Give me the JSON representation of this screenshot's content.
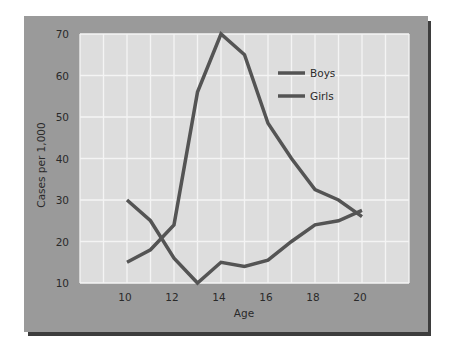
{
  "chart_data": {
    "type": "line",
    "title": "",
    "xlabel": "Age",
    "ylabel": "Cases per 1,000",
    "xlim": [
      8,
      22
    ],
    "ylim": [
      10,
      70
    ],
    "x_ticks": [
      10,
      12,
      14,
      16,
      18,
      20
    ],
    "y_ticks": [
      10,
      20,
      30,
      40,
      50,
      60,
      70
    ],
    "grid": true,
    "legend_position": "upper right (inside plot)",
    "x": [
      10,
      11,
      12,
      13,
      14,
      15,
      16,
      17,
      18,
      19,
      20
    ],
    "series": [
      {
        "name": "Boys",
        "values": [
          30,
          25,
          16,
          10,
          15,
          14,
          15.5,
          20,
          24,
          25,
          27.5
        ]
      },
      {
        "name": "Girls",
        "values": [
          15,
          18,
          24,
          56,
          70,
          65,
          48.5,
          40,
          32.5,
          30,
          26
        ]
      }
    ]
  },
  "colors": {
    "panel": "#9a9a9a",
    "shadow": "#3d3d3d",
    "plot_bg": "#dddddd",
    "grid": "#f4f4f4",
    "boys_line": "#545454",
    "girls_line": "#545454",
    "text": "#2a2a2a"
  },
  "labels": {
    "xlabel": "Age",
    "ylabel": "Cases per 1,000",
    "legend": [
      "Boys",
      "Girls"
    ],
    "x_ticks": [
      "10",
      "12",
      "14",
      "16",
      "18",
      "20"
    ],
    "y_ticks": [
      "70",
      "60",
      "50",
      "40",
      "30",
      "20",
      "10"
    ]
  }
}
